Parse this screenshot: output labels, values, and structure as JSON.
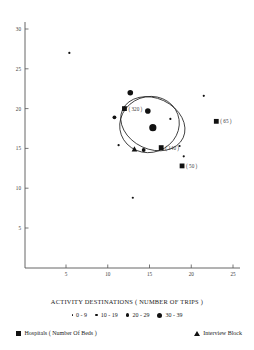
{
  "chart_data": {
    "type": "scatter",
    "title": "",
    "xlabel": "",
    "ylabel": "",
    "xlim": [
      0,
      26
    ],
    "ylim": [
      0,
      31
    ],
    "grid": false,
    "x_ticks": [
      5,
      10,
      15,
      20,
      25
    ],
    "y_ticks": [
      5,
      10,
      15,
      20,
      25,
      30
    ],
    "legend_position": "below-plot",
    "series": [
      {
        "name": "Activity destinations (number of trips)",
        "marker": "circle",
        "size_classes": [
          "0 - 9",
          "10 - 19",
          "20 - 29",
          "30 - 39"
        ],
        "points": [
          {
            "x": 5.4,
            "y": 27.0,
            "size_class": "0 - 9"
          },
          {
            "x": 10.8,
            "y": 18.9,
            "size_class": "10 - 19"
          },
          {
            "x": 12.7,
            "y": 22.0,
            "size_class": "20 - 29"
          },
          {
            "x": 14.8,
            "y": 19.7,
            "size_class": "20 - 29"
          },
          {
            "x": 15.4,
            "y": 17.6,
            "size_class": "30 - 39"
          },
          {
            "x": 17.5,
            "y": 18.7,
            "size_class": "0 - 9"
          },
          {
            "x": 11.3,
            "y": 15.4,
            "size_class": "0 - 9"
          },
          {
            "x": 14.3,
            "y": 14.8,
            "size_class": "10 - 19"
          },
          {
            "x": 18.6,
            "y": 15.3,
            "size_class": "0 - 9"
          },
          {
            "x": 19.1,
            "y": 14.0,
            "size_class": "0 - 9"
          },
          {
            "x": 21.5,
            "y": 21.6,
            "size_class": "0 - 9"
          },
          {
            "x": 13.0,
            "y": 8.8,
            "size_class": "0 - 9"
          }
        ]
      },
      {
        "name": "Hospitals (Number Of Beds)",
        "marker": "square",
        "points": [
          {
            "x": 12.0,
            "y": 20.0,
            "label": "( 320 )"
          },
          {
            "x": 16.4,
            "y": 15.1,
            "label": "( 140 )"
          },
          {
            "x": 18.9,
            "y": 12.8,
            "label": "( 50 )"
          },
          {
            "x": 23.0,
            "y": 18.4,
            "label": "( 65 )"
          }
        ]
      },
      {
        "name": "Interview Block",
        "marker": "triangle",
        "points": [
          {
            "x": 13.2,
            "y": 14.9
          }
        ]
      }
    ],
    "ellipses": [
      {
        "cx": 15.0,
        "cy": 18.0,
        "rx": 3.6,
        "ry": 3.5,
        "rotation": -20
      },
      {
        "cx": 15.4,
        "cy": 18.1,
        "rx": 4.0,
        "ry": 3.2,
        "rotation": 25
      }
    ]
  },
  "axes": {
    "x_tick_labels": [
      "5",
      "10",
      "15",
      "20",
      "25"
    ],
    "y_tick_labels": [
      "5",
      "10",
      "15",
      "20",
      "25",
      "30"
    ]
  },
  "legend": {
    "title": "ACTIVITY DESTINATIONS  ( NUMBER OF TRIPS )",
    "size_entries": [
      {
        "label": "0 - 9",
        "dot_px": 1.6
      },
      {
        "label": "10 - 19",
        "dot_px": 2.6
      },
      {
        "label": "20 - 29",
        "dot_px": 3.8
      },
      {
        "label": "30 - 39",
        "dot_px": 5.0
      }
    ],
    "hospitals_label": "Hospitals ( Number Of Beds )",
    "interview_label": "Interview Block"
  },
  "colors": {
    "ink": "#111111",
    "axis": "#555555",
    "background": "#ffffff"
  }
}
